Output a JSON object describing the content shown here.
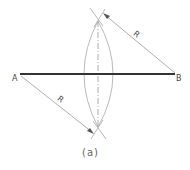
{
  "figure": {
    "caption": "(a)",
    "points": {
      "a_label": "A",
      "b_label": "B"
    },
    "radius_labels": {
      "upper": "R",
      "lower": "R"
    },
    "colors": {
      "segment": "#333333",
      "construction": "#9a9a9a",
      "text": "#444444"
    }
  }
}
